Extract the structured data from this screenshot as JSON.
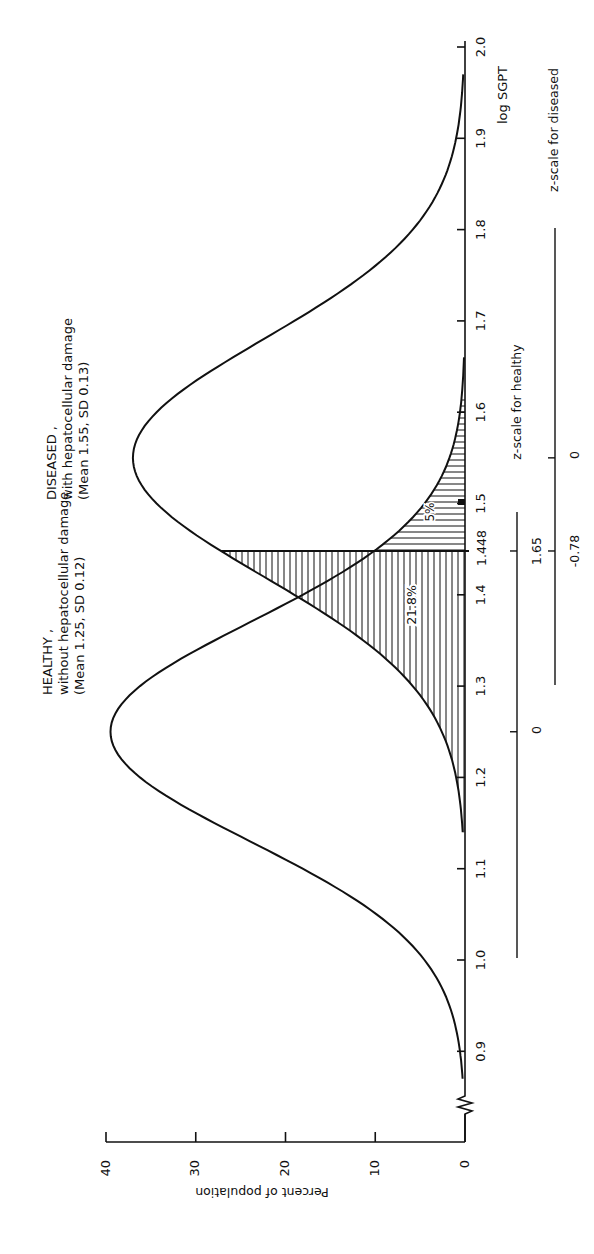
{
  "chart_data": {
    "type": "line",
    "orientation": "rotated-90-clockwise",
    "title": "",
    "xlabel": "log SGPT",
    "ylabel": "Percent of population",
    "xlim": [
      0.85,
      2.0
    ],
    "ylim": [
      0,
      40
    ],
    "x_ticks": [
      "0.9",
      "1.0",
      "1.1",
      "1.2",
      "1.3",
      "1.4",
      "1.5",
      "1.6",
      "1.7",
      "1.8",
      "1.9",
      "2.0"
    ],
    "y_ticks": [
      "0",
      "10",
      "20",
      "30",
      "40"
    ],
    "axis_break": true,
    "grid": false,
    "series": [
      {
        "name": "HEALTHY, without hepatocellular damage",
        "label_lines": [
          "HEALTHY ,",
          "without hepatocellular damage",
          "(Mean 1.25, SD 0.12)"
        ],
        "mean": 1.25,
        "sd": 0.12,
        "peak_percent": 39.5,
        "x": [
          0.87,
          0.9,
          0.95,
          1.0,
          1.05,
          1.1,
          1.15,
          1.2,
          1.25,
          1.3,
          1.35,
          1.4,
          1.448,
          1.5,
          1.55,
          1.6,
          1.66
        ],
        "values": [
          0.3,
          1.3,
          4.6,
          8.7,
          15.6,
          24.0,
          32.2,
          37.6,
          39.5,
          37.6,
          32.2,
          24.7,
          17.8,
          8.5,
          3.8,
          1.3,
          0.0
        ]
      },
      {
        "name": "DISEASED, with hepatocellular damage",
        "label_lines": [
          "DISEASED ,",
          "with hepatocellular damage",
          "(Mean 1.55, SD 0.13)"
        ],
        "mean": 1.55,
        "sd": 0.13,
        "peak_percent": 37.0,
        "x": [
          1.14,
          1.2,
          1.25,
          1.3,
          1.35,
          1.4,
          1.448,
          1.5,
          1.55,
          1.6,
          1.65,
          1.7,
          1.75,
          1.8,
          1.85,
          1.9,
          1.97
        ],
        "values": [
          0.0,
          1.9,
          4.8,
          9.4,
          15.3,
          21.6,
          26.3,
          34.2,
          37.0,
          34.2,
          27.5,
          19.6,
          11.0,
          6.1,
          3.2,
          1.3,
          0.0
        ]
      }
    ],
    "annotations": {
      "cutoff": {
        "x": 1.448,
        "label": "1.448"
      },
      "crossover": {
        "x": 1.41,
        "percent": 19
      },
      "shaded_diseased_below_cutoff": {
        "label": "21.8%",
        "hatch": "vertical"
      },
      "shaded_healthy_above_cutoff": {
        "label": "5%",
        "hatch": "horizontal"
      },
      "z_scale_healthy": {
        "label": "z-scale for healthy",
        "ticks": [
          {
            "x": 1.25,
            "z": "0"
          },
          {
            "x": 1.448,
            "z": "1.65"
          }
        ]
      },
      "z_scale_diseased": {
        "label": "z-scale for diseased",
        "ticks": [
          {
            "x": 1.55,
            "z": "0"
          },
          {
            "x": 1.448,
            "z": "-0.78"
          }
        ]
      }
    }
  },
  "labels": {
    "healthy_1": "HEALTHY ,",
    "healthy_2": "without hepatocellular damage",
    "healthy_3": "(Mean 1.25,  SD 0.12)",
    "diseased_1": "DISEASED ,",
    "diseased_2": "with hepatocellular damage",
    "diseased_3": "(Mean 1.55,  SD 0.13)",
    "pct_diseased": "21.8%",
    "pct_healthy": "5%",
    "cutoff": "1.448",
    "xlabel": "log SGPT",
    "ylabel": "Percent of population",
    "z_healthy": "z-scale for healthy",
    "z_diseased": "z-scale for diseased",
    "z_h_0": "0",
    "z_h_cut": "1.65",
    "z_d_0": "0",
    "z_d_cut": "-0.78"
  }
}
